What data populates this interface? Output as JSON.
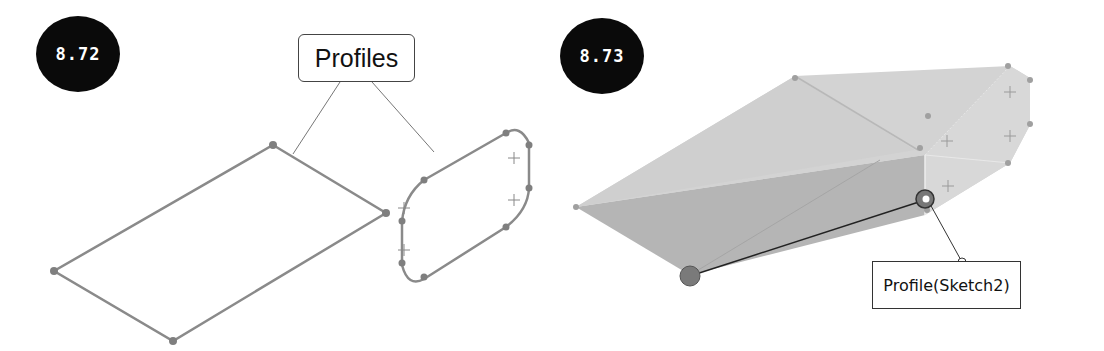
{
  "figures": [
    {
      "number": "8.72",
      "callout": "Profiles",
      "description": "Two sketch profiles: a parallelogram and a rounded-corner profile"
    },
    {
      "number": "8.73",
      "callout": "Profile(Sketch2)",
      "description": "Loft preview between the two profiles with connector handle"
    }
  ],
  "colors": {
    "badge": "#0a0a0a",
    "sketch_line": "#8a8a8a",
    "loft_fill_light": "#d4d4d4",
    "loft_fill_dark": "#b0b0b0"
  }
}
